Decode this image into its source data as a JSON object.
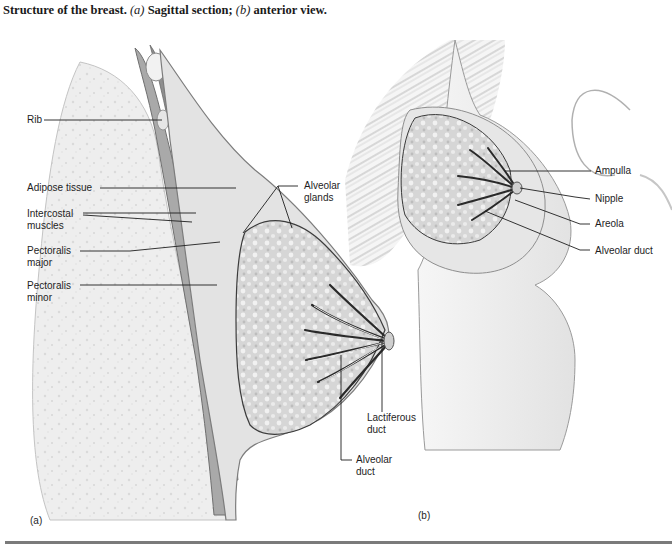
{
  "caption": {
    "lead": "Structure of the breast.",
    "a_marker": "(a)",
    "a_text": "Sagittal section;",
    "b_marker": "(b)",
    "b_text": "anterior view."
  },
  "panels": {
    "a": {
      "label": "(a)",
      "title": "Sagittal section"
    },
    "b": {
      "label": "(b)",
      "title": "Anterior view"
    }
  },
  "labels_a": {
    "rib": "Rib",
    "adipose": "Adipose tissue",
    "intercostal": "Intercostal\nmuscles",
    "pec_major": "Pectoralis\nmajor",
    "pec_minor": "Pectoralis\nminor",
    "alveolar_glands": "Alveolar\nglands",
    "lactiferous_duct": "Lactiferous\nduct",
    "alveolar_duct": "Alveolar\nduct"
  },
  "labels_b": {
    "ampulla": "Ampulla",
    "nipple": "Nipple",
    "areola": "Areola",
    "alveolar_duct": "Alveolar duct"
  },
  "colors": {
    "ink": "#1e1e1e",
    "tissue_light": "#ececec",
    "tissue_mid": "#c8c8c8",
    "gland": "#d9d9d9",
    "muscle": "#9a9a9a",
    "duct_dark": "#2a2a2a",
    "rule": "#7a7a7a"
  }
}
